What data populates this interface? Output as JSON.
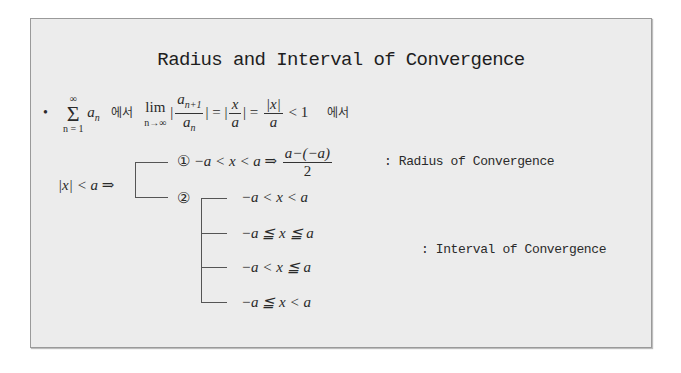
{
  "slide": {
    "title": "Radius and Interval of Convergence",
    "formula_line": {
      "bullet": "•",
      "sum_upper": "∞",
      "sum_symbol": "Σ",
      "sum_lower": "n = 1",
      "sum_term": "a",
      "sum_term_sub": "n",
      "korean_1": "에서",
      "lim_word": "lim",
      "lim_sub": "n→∞",
      "ratio_num": "a",
      "ratio_num_sub": "n+1",
      "ratio_den": "a",
      "ratio_den_sub": "n",
      "abs_open": "|",
      "abs_close": "|",
      "eq1": "=",
      "frac2_num": "x",
      "frac2_den": "a",
      "eq2": "=",
      "frac3_num": "|x|",
      "frac3_den": "a",
      "lt_one": "< 1",
      "korean_2": "에서"
    },
    "condition": "|x| < a ⇒",
    "case1": {
      "marker": "①",
      "inequality": "−a < x < a ⇒",
      "frac_num": "a−(−a)",
      "frac_den": "2",
      "label": ": Radius of Convergence"
    },
    "case2": {
      "marker": "②",
      "intervals": [
        "−a < x < a",
        "−a ≦ x ≦ a",
        "−a < x ≦ a",
        "−a ≦ x < a"
      ],
      "label": ": Interval of Convergence"
    }
  },
  "colors": {
    "slide_bg": "#ececec",
    "border": "#9a9a9a",
    "text": "#222222"
  }
}
